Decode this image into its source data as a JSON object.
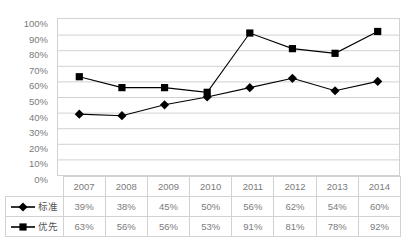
{
  "chart_data": {
    "type": "line",
    "title": "",
    "xlabel": "",
    "ylabel": "",
    "categories": [
      "2007",
      "2008",
      "2009",
      "2010",
      "2011",
      "2012",
      "2013",
      "2014"
    ],
    "series": [
      {
        "name": "标准",
        "marker": "diamond",
        "color": "#000000",
        "values": [
          39,
          38,
          45,
          50,
          56,
          62,
          54,
          60
        ],
        "labels": [
          "39%",
          "38%",
          "45%",
          "50%",
          "56%",
          "62%",
          "54%",
          "60%"
        ]
      },
      {
        "name": "优先",
        "marker": "square",
        "color": "#000000",
        "values": [
          63,
          56,
          56,
          53,
          91,
          81,
          78,
          92
        ],
        "labels": [
          "63%",
          "56%",
          "56%",
          "53%",
          "91%",
          "81%",
          "78%",
          "92%"
        ]
      }
    ],
    "ylim": [
      0,
      100
    ],
    "ytick_labels": [
      "100%",
      "90%",
      "80%",
      "70%",
      "60%",
      "50%",
      "40%",
      "30%",
      "20%",
      "10%",
      "0%"
    ],
    "ytick_values": [
      100,
      90,
      80,
      70,
      60,
      50,
      40,
      30,
      20,
      10,
      0
    ],
    "grid": true,
    "grid_axis": "y",
    "legend_position": "data-table-row-header",
    "value_suffix": "%"
  },
  "table": {
    "corner_label": "",
    "header": [
      "2007",
      "2008",
      "2009",
      "2010",
      "2011",
      "2012",
      "2013",
      "2014"
    ],
    "rows": [
      {
        "label": "标准",
        "marker": "diamond",
        "values": [
          "39%",
          "38%",
          "45%",
          "50%",
          "56%",
          "62%",
          "54%",
          "60%"
        ]
      },
      {
        "label": "优先",
        "marker": "square",
        "values": [
          "63%",
          "56%",
          "56%",
          "53%",
          "91%",
          "81%",
          "78%",
          "92%"
        ]
      }
    ]
  },
  "colors": {
    "grid": "#d2d2d2",
    "axis_text": "#7b7b7b",
    "series": "#000000",
    "background": "#ffffff"
  }
}
